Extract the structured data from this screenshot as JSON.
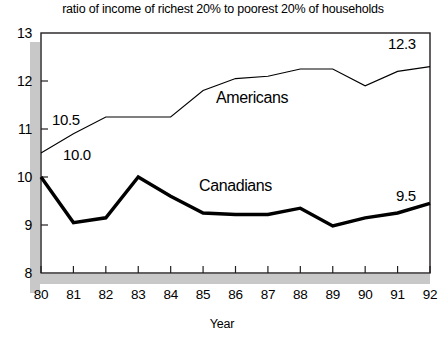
{
  "chart_data": {
    "type": "line",
    "title": "ratio of income of richest 20% to poorest 20% of households",
    "xlabel": "Year",
    "ylabel": "",
    "x": [
      "80",
      "81",
      "82",
      "83",
      "84",
      "85",
      "86",
      "87",
      "88",
      "89",
      "90",
      "91",
      "92"
    ],
    "xlim": [
      80,
      92
    ],
    "ylim": [
      8,
      13
    ],
    "yticks": [
      "8",
      "9",
      "10",
      "11",
      "12",
      "13"
    ],
    "grid": false,
    "legend_position": "inline-annotation",
    "series": [
      {
        "name": "Americans",
        "values": [
          10.5,
          10.9,
          11.25,
          11.25,
          11.25,
          11.8,
          12.05,
          12.1,
          12.25,
          12.25,
          11.9,
          12.2,
          12.3
        ],
        "color": "#000000",
        "line_width": 1.1,
        "label": "Americans",
        "label_x": 216,
        "label_y": 89,
        "start_label": "10.5",
        "start_label_x": 52,
        "start_label_y": 112,
        "end_label": "12.3",
        "end_label_x": 388,
        "end_label_y": 36
      },
      {
        "name": "Canadians",
        "values": [
          10.0,
          9.05,
          9.15,
          10.0,
          9.6,
          9.25,
          9.22,
          9.22,
          9.35,
          8.98,
          9.15,
          9.25,
          9.45
        ],
        "color": "#000000",
        "line_width": 3.4,
        "label": "Canadians",
        "label_x": 199,
        "label_y": 177,
        "start_label": "10.0",
        "start_label_x": 63,
        "start_label_y": 147,
        "end_label": "9.5",
        "end_label_x": 396,
        "end_label_y": 188
      }
    ],
    "colors": {
      "frame": "#231f20",
      "shadow": "#c8c8c8",
      "background": "#ffffff",
      "text": "#000000"
    }
  }
}
